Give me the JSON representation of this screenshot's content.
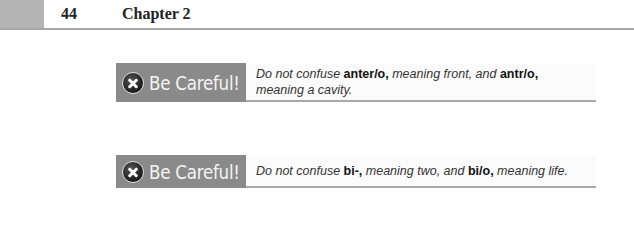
{
  "header": {
    "page_number": "44",
    "chapter_title": "Chapter 2"
  },
  "callouts": [
    {
      "label": "Be Careful!",
      "icon": "x-circle-icon",
      "text": {
        "p1": "Do not confuse ",
        "b1": "anter/o,",
        "p2": " meaning front, and ",
        "b2": "antr/o,",
        "p3": " meaning a cavity."
      }
    },
    {
      "label": "Be Careful!",
      "icon": "x-circle-icon",
      "text": {
        "p1": "Do not confuse ",
        "b1": "bi-,",
        "p2": " meaning two, and ",
        "b2": "bi/o,",
        "p3": " meaning life."
      }
    }
  ],
  "colors": {
    "label_bg": "#8a8a8a",
    "header_block": "#b4b4b4",
    "rule": "#a6a6a6"
  }
}
